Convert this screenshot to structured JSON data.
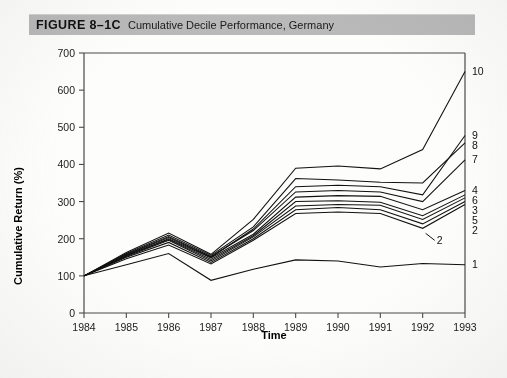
{
  "figure": {
    "number_label": "FIGURE 8–1C",
    "title": "Cumulative Decile Performance, Germany"
  },
  "chart_data": {
    "type": "line",
    "title": "Cumulative Decile Performance, Germany",
    "xlabel": "Time",
    "ylabel": "Cumulative Return (%)",
    "x": [
      1984,
      1985,
      1986,
      1987,
      1988,
      1989,
      1990,
      1991,
      1992,
      1993
    ],
    "xtick_labels": [
      "1984",
      "1985",
      "1986",
      "1987",
      "1988",
      "1989",
      "1990",
      "1991",
      "1992",
      "1993"
    ],
    "ytick_labels": [
      "0",
      "100",
      "200",
      "300",
      "400",
      "500",
      "600",
      "700"
    ],
    "yticks": [
      0,
      100,
      200,
      300,
      400,
      500,
      600,
      700
    ],
    "xlim": [
      1984,
      1993
    ],
    "ylim": [
      0,
      700
    ],
    "grid": false,
    "legend_position": "right-of-axis-endpoint-labels",
    "series": [
      {
        "name": "1",
        "label": "1",
        "values": [
          100,
          130,
          160,
          88,
          118,
          143,
          140,
          124,
          133,
          130
        ]
      },
      {
        "name": "2",
        "label": "2",
        "values": [
          100,
          146,
          183,
          132,
          196,
          268,
          272,
          268,
          228,
          292
        ]
      },
      {
        "name": "3",
        "label": "3",
        "values": [
          100,
          152,
          196,
          140,
          205,
          288,
          292,
          290,
          252,
          310
        ]
      },
      {
        "name": "4",
        "label": "4",
        "values": [
          100,
          155,
          200,
          148,
          212,
          312,
          316,
          314,
          278,
          330
        ]
      },
      {
        "name": "5",
        "label": "5",
        "values": [
          100,
          150,
          190,
          136,
          200,
          278,
          284,
          278,
          240,
          300
        ]
      },
      {
        "name": "6",
        "label": "6",
        "values": [
          100,
          154,
          198,
          144,
          208,
          300,
          302,
          298,
          262,
          318
        ]
      },
      {
        "name": "7",
        "label": "7",
        "values": [
          100,
          158,
          206,
          152,
          222,
          326,
          330,
          326,
          300,
          412
        ]
      },
      {
        "name": "8",
        "label": "8",
        "values": [
          100,
          160,
          210,
          155,
          232,
          362,
          358,
          352,
          350,
          458
        ]
      },
      {
        "name": "9",
        "label": "9",
        "values": [
          100,
          157,
          203,
          150,
          226,
          340,
          344,
          340,
          318,
          478
        ]
      },
      {
        "name": "10",
        "label": "10",
        "values": [
          100,
          163,
          215,
          158,
          252,
          390,
          396,
          388,
          440,
          650
        ]
      }
    ],
    "annotations": [
      {
        "text": "2",
        "points_to_year": 1992,
        "points_to_value": 228
      }
    ]
  }
}
